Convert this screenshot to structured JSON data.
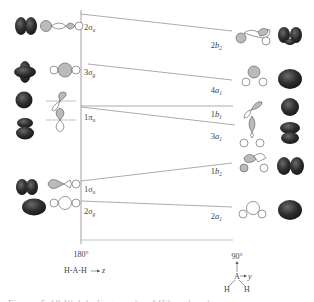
{
  "diagram": {
    "type": "walsh-diagram",
    "left_axis": {
      "angle_label": "180°",
      "geometry_label": "H-A-H",
      "axis_label": "z"
    },
    "right_axis": {
      "angle_label": "90°",
      "atom_center": "A",
      "atom_h1": "H",
      "atom_h2": "H",
      "axis_label": "y"
    },
    "correlations": [
      {
        "left": {
          "num": "2",
          "sym": "σ",
          "sub": "u"
        },
        "right": {
          "num": "2",
          "sym": "b",
          "sub": "2"
        }
      },
      {
        "left": {
          "num": "3",
          "sym": "σ",
          "sub": "g"
        },
        "right": {
          "num": "4",
          "sym": "a",
          "sub": "1"
        }
      },
      {
        "left": {
          "num": "1",
          "sym": "π",
          "sub": "u"
        },
        "right": {
          "num": "1",
          "sym": "b",
          "sub": "1"
        }
      },
      {
        "left": {
          "num": "",
          "sym": "",
          "sub": ""
        },
        "right": {
          "num": "3",
          "sym": "a",
          "sub": "1"
        }
      },
      {
        "left": {
          "num": "1",
          "sym": "σ",
          "sub": "u"
        },
        "right": {
          "num": "1",
          "sym": "b",
          "sub": "2"
        }
      },
      {
        "left": {
          "num": "2",
          "sym": "σ",
          "sub": "g"
        },
        "right": {
          "num": "2",
          "sym": "a",
          "sub": "1"
        }
      }
    ],
    "colors": {
      "line": "#888888",
      "lobe_shaded": "#b8b8b8",
      "lobe_open": "#ffffff",
      "orbital_surface": "#3a3a3a"
    }
  },
  "caption": "Figure 5-18  Walsh diagram for AH2 molecules"
}
